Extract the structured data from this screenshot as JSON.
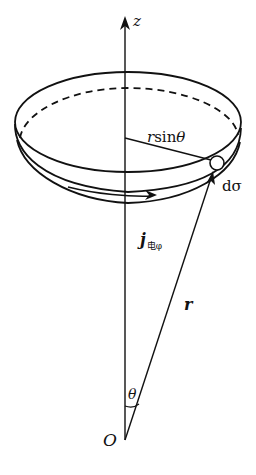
{
  "figure": {
    "type": "physics-diagram",
    "labels": {
      "z_axis": "z",
      "radius_proj": "rsinθ",
      "radius_proj_r": "r",
      "radius_proj_sin": "sin",
      "radius_proj_theta": "θ",
      "area_element": "dσ",
      "current_density_main": "j",
      "current_density_sub": "电φ",
      "position_vector": "r",
      "angle": "θ",
      "origin": "O"
    },
    "colors": {
      "ink": "#111111",
      "background": "#ffffff"
    }
  }
}
